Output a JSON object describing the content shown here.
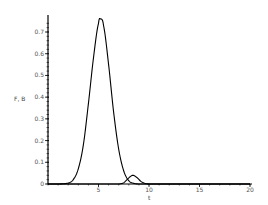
{
  "chart_data": {
    "type": "line",
    "title": "",
    "xlabel": "t",
    "ylabel": "F, B",
    "xlim": [
      0,
      20
    ],
    "ylim": [
      0,
      0.77
    ],
    "xticks": [
      0,
      5,
      10,
      15,
      20
    ],
    "xtick_labels": [
      "5",
      "10",
      "15",
      "20"
    ],
    "yticks": [
      0,
      0.1,
      0.2,
      0.3,
      0.4,
      0.5,
      0.6,
      0.7
    ],
    "ytick_labels": [
      "0",
      "0.1",
      "0.2",
      "0.3",
      "0.4",
      "0.5",
      "0.6",
      "0.7"
    ],
    "grid": false,
    "legend": null,
    "series": [
      {
        "name": "F",
        "description": "Large single peak",
        "x": [
          0,
          1,
          2,
          2.5,
          3,
          3.5,
          4,
          4.5,
          5,
          5.2,
          5.5,
          6,
          6.5,
          7,
          7.5,
          8,
          8.5,
          9,
          10,
          15,
          20
        ],
        "values": [
          0,
          0.0,
          0.004,
          0.02,
          0.07,
          0.18,
          0.37,
          0.58,
          0.74,
          0.76,
          0.73,
          0.55,
          0.33,
          0.16,
          0.06,
          0.015,
          0.003,
          0,
          0,
          0,
          0
        ]
      },
      {
        "name": "B",
        "description": "Small secondary bump",
        "x": [
          0,
          7,
          7.5,
          8,
          8.4,
          8.8,
          9.2,
          9.6,
          10,
          15,
          20
        ],
        "values": [
          0,
          0,
          0.006,
          0.028,
          0.04,
          0.03,
          0.012,
          0.003,
          0,
          0,
          0
        ]
      }
    ]
  },
  "axes": {
    "x_label": "t",
    "y_label": "F, B"
  }
}
